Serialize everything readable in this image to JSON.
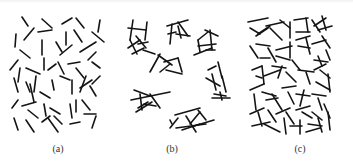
{
  "figure": {
    "stroke_color": "#141414",
    "background": "#ffffff",
    "panels": [
      {
        "id": "a",
        "label": "(a)",
        "description": "dispersed isolated rods",
        "label_x": 58,
        "segments": [
          [
            22,
            17,
            28,
            26
          ],
          [
            42,
            19,
            52,
            28
          ],
          [
            62,
            24,
            72,
            18
          ],
          [
            76,
            18,
            84,
            28
          ],
          [
            100,
            20,
            98,
            32
          ],
          [
            16,
            34,
            15,
            47
          ],
          [
            24,
            40,
            34,
            28
          ],
          [
            38,
            32,
            52,
            30
          ],
          [
            42,
            40,
            42,
            55
          ],
          [
            56,
            42,
            62,
            52
          ],
          [
            66,
            32,
            66,
            45
          ],
          [
            74,
            30,
            82,
            42
          ],
          [
            92,
            32,
            104,
            42
          ],
          [
            20,
            50,
            30,
            58
          ],
          [
            60,
            55,
            72,
            45
          ],
          [
            80,
            52,
            96,
            42
          ],
          [
            96,
            52,
            88,
            60
          ],
          [
            10,
            70,
            18,
            60
          ],
          [
            20,
            68,
            18,
            82
          ],
          [
            26,
            68,
            40,
            74
          ],
          [
            44,
            70,
            44,
            58
          ],
          [
            48,
            70,
            56,
            64
          ],
          [
            58,
            62,
            64,
            74
          ],
          [
            68,
            64,
            80,
            62
          ],
          [
            76,
            68,
            84,
            78
          ],
          [
            92,
            62,
            100,
            68
          ],
          [
            14,
            78,
            18,
            92
          ],
          [
            26,
            82,
            30,
            92
          ],
          [
            36,
            76,
            34,
            92
          ],
          [
            30,
            84,
            34,
            102
          ],
          [
            40,
            92,
            50,
            98
          ],
          [
            52,
            80,
            54,
            90
          ],
          [
            60,
            76,
            70,
            80
          ],
          [
            72,
            80,
            72,
            94
          ],
          [
            86,
            76,
            80,
            92
          ],
          [
            90,
            86,
            96,
            96
          ],
          [
            100,
            76,
            92,
            84
          ],
          [
            12,
            108,
            18,
            100
          ],
          [
            22,
            106,
            36,
            102
          ],
          [
            28,
            110,
            38,
            118
          ],
          [
            44,
            104,
            46,
            116
          ],
          [
            50,
            108,
            60,
            114
          ],
          [
            54,
            116,
            62,
            124
          ],
          [
            70,
            104,
            72,
            118
          ],
          [
            76,
            100,
            76,
            112
          ],
          [
            82,
            100,
            90,
            110
          ],
          [
            84,
            114,
            96,
            114
          ],
          [
            14,
            118,
            18,
            130
          ],
          [
            26,
            120,
            34,
            132
          ],
          [
            42,
            122,
            50,
            116
          ],
          [
            48,
            118,
            58,
            132
          ],
          [
            70,
            124,
            80,
            122
          ],
          [
            96,
            116,
            92,
            128
          ],
          [
            80,
            88,
            92,
            80
          ]
        ]
      },
      {
        "id": "b",
        "label": "(b)",
        "description": "clustered aggregates",
        "label_x": 172,
        "segments": [
          [
            133,
            20,
            130,
            40
          ],
          [
            147,
            22,
            145,
            40
          ],
          [
            128,
            28,
            146,
            30
          ],
          [
            130,
            40,
            137,
            54
          ],
          [
            136,
            36,
            146,
            48
          ],
          [
            140,
            40,
            128,
            48
          ],
          [
            143,
            50,
            155,
            54
          ],
          [
            132,
            54,
            144,
            48
          ],
          [
            138,
            44,
            148,
            42
          ],
          [
            167,
            26,
            188,
            20
          ],
          [
            172,
            24,
            170,
            44
          ],
          [
            168,
            34,
            176,
            32
          ],
          [
            176,
            34,
            190,
            36
          ],
          [
            178,
            22,
            188,
            36
          ],
          [
            181,
            38,
            178,
            26
          ],
          [
            198,
            40,
            208,
            32
          ],
          [
            205,
            30,
            218,
            36
          ],
          [
            210,
            30,
            212,
            50
          ],
          [
            198,
            40,
            200,
            52
          ],
          [
            198,
            46,
            216,
            44
          ],
          [
            194,
            55,
            212,
            48
          ],
          [
            206,
            50,
            215,
            50
          ],
          [
            158,
            55,
            172,
            65
          ],
          [
            160,
            54,
            150,
            72
          ],
          [
            164,
            62,
            178,
            58
          ],
          [
            178,
            58,
            182,
            72
          ],
          [
            166,
            70,
            182,
            74
          ],
          [
            170,
            64,
            160,
            72
          ],
          [
            208,
            70,
            216,
            66
          ],
          [
            218,
            62,
            222,
            78
          ],
          [
            212,
            74,
            216,
            90
          ],
          [
            206,
            78,
            220,
            86
          ],
          [
            222,
            76,
            226,
            92
          ],
          [
            214,
            94,
            226,
            96
          ],
          [
            220,
            92,
            222,
            100
          ],
          [
            212,
            98,
            230,
            98
          ],
          [
            131,
            100,
            170,
            92
          ],
          [
            134,
            90,
            150,
            96
          ],
          [
            150,
            94,
            160,
            108
          ],
          [
            140,
            94,
            142,
            110
          ],
          [
            148,
            102,
            138,
            108
          ],
          [
            136,
            112,
            152,
            102
          ],
          [
            144,
            104,
            156,
            106
          ],
          [
            170,
            120,
            172,
            124
          ],
          [
            175,
            115,
            200,
            108
          ],
          [
            178,
            118,
            170,
            128
          ],
          [
            186,
            116,
            196,
            132
          ],
          [
            176,
            128,
            206,
            124
          ],
          [
            198,
            110,
            206,
            120
          ],
          [
            200,
            112,
            190,
            124
          ],
          [
            194,
            126,
            214,
            120
          ],
          [
            182,
            130,
            200,
            124
          ]
        ]
      },
      {
        "id": "c",
        "label": "(c)",
        "description": "percolating network",
        "label_x": 300,
        "segments": [
          [
            248,
            22,
            268,
            18
          ],
          [
            250,
            28,
            260,
            34
          ],
          [
            258,
            34,
            270,
            26
          ],
          [
            256,
            36,
            268,
            28
          ],
          [
            266,
            26,
            284,
            22
          ],
          [
            270,
            28,
            282,
            40
          ],
          [
            280,
            20,
            290,
            28
          ],
          [
            290,
            22,
            290,
            38
          ],
          [
            294,
            20,
            308,
            18
          ],
          [
            306,
            18,
            308,
            32
          ],
          [
            312,
            20,
            320,
            32
          ],
          [
            314,
            26,
            326,
            18
          ],
          [
            322,
            16,
            326,
            30
          ],
          [
            318,
            30,
            332,
            26
          ],
          [
            296,
            32,
            310,
            32
          ],
          [
            250,
            46,
            258,
            58
          ],
          [
            256,
            44,
            270,
            46
          ],
          [
            260,
            58,
            270,
            58
          ],
          [
            268,
            48,
            276,
            62
          ],
          [
            276,
            50,
            292,
            46
          ],
          [
            276,
            56,
            290,
            60
          ],
          [
            290,
            42,
            290,
            58
          ],
          [
            296,
            40,
            310,
            36
          ],
          [
            298,
            46,
            310,
            48
          ],
          [
            306,
            38,
            310,
            54
          ],
          [
            312,
            44,
            326,
            40
          ],
          [
            322,
            36,
            330,
            48
          ],
          [
            326,
            50,
            330,
            60
          ],
          [
            318,
            56,
            322,
            66
          ],
          [
            314,
            60,
            328,
            62
          ],
          [
            252,
            70,
            262,
            66
          ],
          [
            262,
            66,
            264,
            84
          ],
          [
            256,
            76,
            262,
            78
          ],
          [
            264,
            76,
            280,
            70
          ],
          [
            272,
            66,
            286,
            68
          ],
          [
            282,
            66,
            278,
            78
          ],
          [
            286,
            72,
            296,
            82
          ],
          [
            292,
            60,
            300,
            70
          ],
          [
            298,
            70,
            314,
            72
          ],
          [
            306,
            72,
            310,
            84
          ],
          [
            314,
            70,
            326,
            64
          ],
          [
            320,
            70,
            330,
            78
          ],
          [
            328,
            74,
            330,
            92
          ],
          [
            316,
            82,
            330,
            90
          ],
          [
            250,
            90,
            264,
            84
          ],
          [
            254,
            94,
            256,
            110
          ],
          [
            262,
            92,
            276,
            96
          ],
          [
            266,
            100,
            278,
            98
          ],
          [
            272,
            94,
            282,
            110
          ],
          [
            282,
            88,
            296,
            86
          ],
          [
            288,
            92,
            294,
            104
          ],
          [
            296,
            94,
            310,
            96
          ],
          [
            304,
            90,
            300,
            106
          ],
          [
            312,
            94,
            326,
            96
          ],
          [
            318,
            98,
            322,
            110
          ],
          [
            250,
            114,
            264,
            108
          ],
          [
            258,
            112,
            262,
            126
          ],
          [
            268,
            110,
            276,
            122
          ],
          [
            276,
            114,
            290,
            108
          ],
          [
            286,
            112,
            294,
            124
          ],
          [
            296,
            110,
            310,
            106
          ],
          [
            302,
            112,
            312,
            118
          ],
          [
            312,
            112,
            322,
            120
          ],
          [
            324,
            104,
            330,
            118
          ],
          [
            252,
            126,
            270,
            122
          ],
          [
            264,
            124,
            280,
            132
          ],
          [
            284,
            118,
            286,
            134
          ],
          [
            290,
            126,
            302,
            126
          ],
          [
            300,
            120,
            300,
            134
          ],
          [
            308,
            124,
            322,
            126
          ],
          [
            318,
            118,
            322,
            132
          ],
          [
            328,
            112,
            330,
            130
          ],
          [
            306,
            132,
            320,
            128
          ]
        ]
      }
    ]
  }
}
